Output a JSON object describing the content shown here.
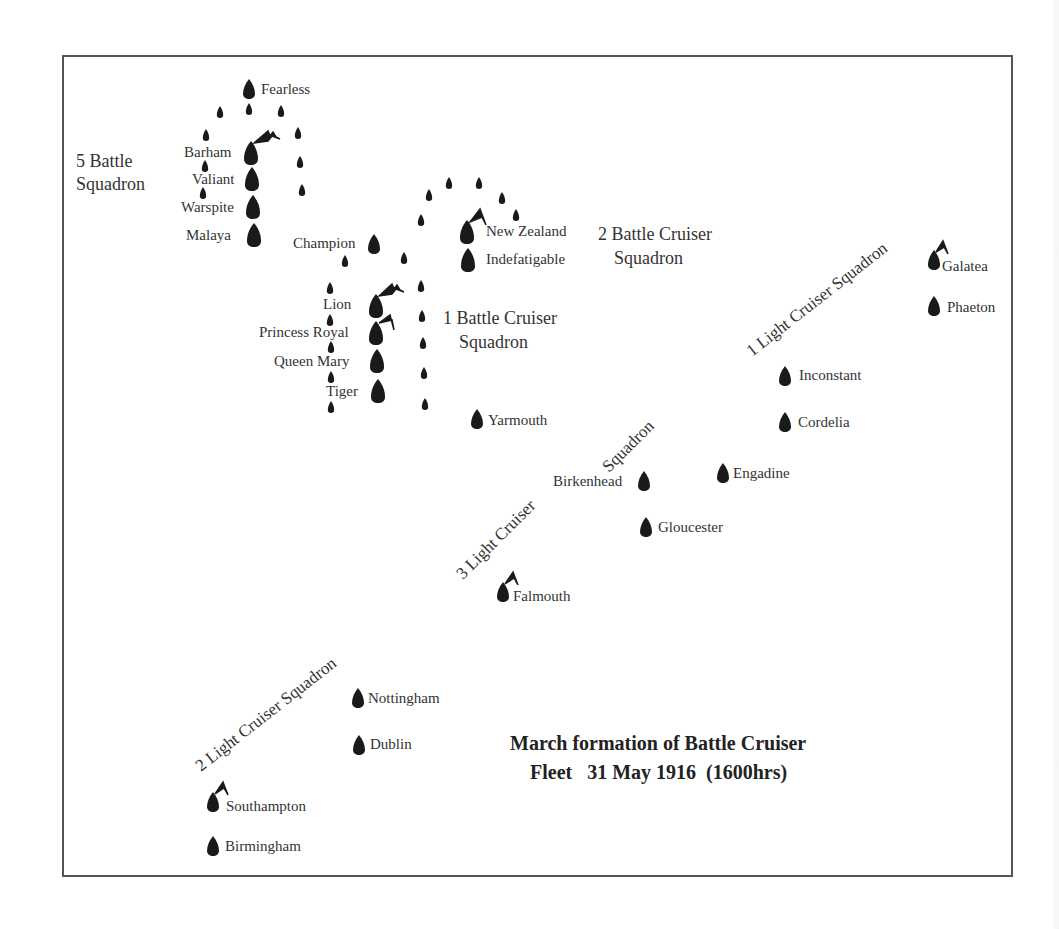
{
  "title": {
    "line1": "March formation of Battle Cruiser",
    "line2": "Fleet   31 May 1916  (1600hrs)"
  },
  "squadron_labels": {
    "bs5_line1": "5 Battle",
    "bs5_line2": "Squadron",
    "bcs2_line1": "2 Battle Cruiser",
    "bcs2_line2": "Squadron",
    "bcs1_line1": "1 Battle Cruiser",
    "bcs1_line2": "Squadron",
    "lcs1": "1 Light Cruiser Squadron",
    "lcs3_part1": "3 Light Cruiser",
    "lcs3_part2": "Squadron",
    "lcs2": "2 Light Cruiser Squadron"
  },
  "ships": {
    "fearless": "Fearless",
    "barham": "Barham",
    "valiant": "Valiant",
    "warspite": "Warspite",
    "malaya": "Malaya",
    "champion": "Champion",
    "new_zealand": "New Zealand",
    "indefatigable": "Indefatigable",
    "lion": "Lion",
    "princess_royal": "Princess Royal",
    "queen_mary": "Queen Mary",
    "tiger": "Tiger",
    "yarmouth": "Yarmouth",
    "galatea": "Galatea",
    "phaeton": "Phaeton",
    "inconstant": "Inconstant",
    "cordelia": "Cordelia",
    "engadine": "Engadine",
    "birkenhead": "Birkenhead",
    "gloucester": "Gloucester",
    "falmouth": "Falmouth",
    "nottingham": "Nottingham",
    "dublin": "Dublin",
    "southampton": "Southampton",
    "birmingham": "Birmingham"
  },
  "legend_icons": {
    "ship": "ship-silhouette-icon",
    "destroyer": "destroyer-icon",
    "flagship": "flag-icon"
  }
}
